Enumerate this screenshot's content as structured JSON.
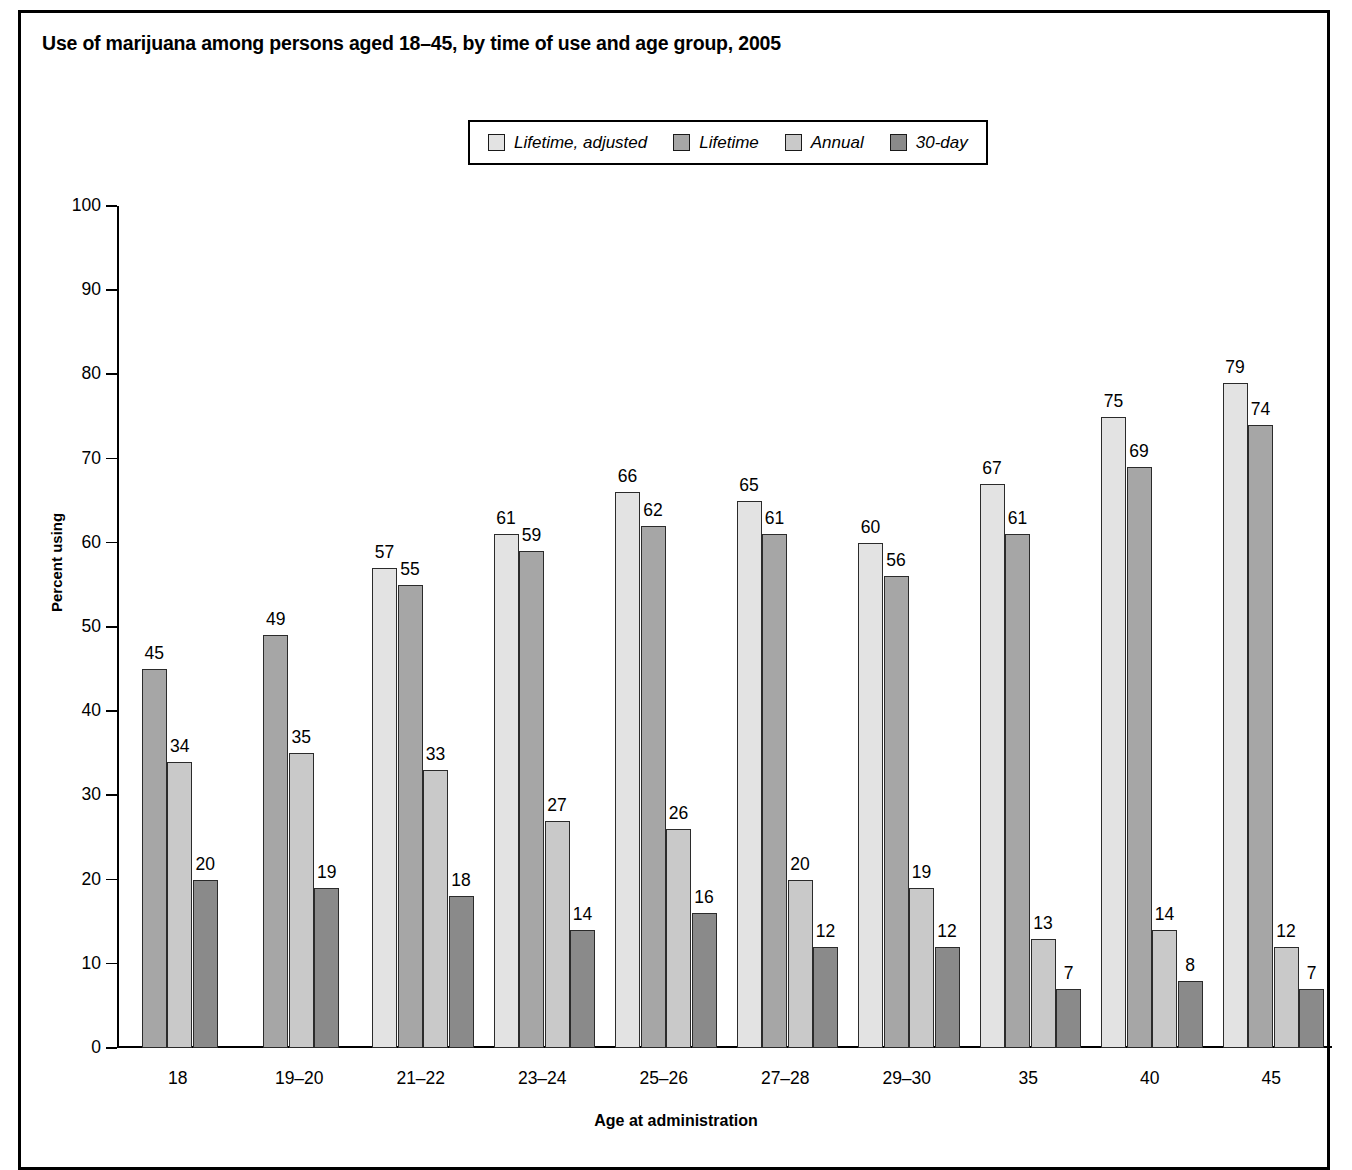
{
  "title": "Use of marijuana among persons aged 18–45, by time of use and age group, 2005",
  "axis": {
    "x_title": "Age at administration",
    "y_title": "Percent using"
  },
  "legend": {
    "items": [
      {
        "label": "Lifetime, adjusted",
        "color": "#e3e3e3"
      },
      {
        "label": "Lifetime",
        "color": "#a6a6a6"
      },
      {
        "label": "Annual",
        "color": "#c9c9c9"
      },
      {
        "label": "30-day",
        "color": "#8a8a8a"
      }
    ]
  },
  "chart_data": {
    "type": "bar",
    "title": "Use of marijuana among persons aged 18–45, by time of use and age group, 2005",
    "xlabel": "Age at administration",
    "ylabel": "Percent using",
    "ylim": [
      0,
      100
    ],
    "yticks": [
      0,
      10,
      20,
      30,
      40,
      50,
      60,
      70,
      80,
      90,
      100
    ],
    "grid": false,
    "legend_position": "top-center",
    "categories": [
      "18",
      "19–20",
      "21–22",
      "23–24",
      "25–26",
      "27–28",
      "29–30",
      "35",
      "40",
      "45"
    ],
    "series": [
      {
        "name": "Lifetime, adjusted",
        "color": "#e3e3e3",
        "values": [
          null,
          null,
          57,
          61,
          66,
          65,
          60,
          67,
          75,
          79
        ]
      },
      {
        "name": "Lifetime",
        "color": "#a6a6a6",
        "values": [
          45,
          49,
          55,
          59,
          62,
          61,
          56,
          61,
          69,
          74
        ]
      },
      {
        "name": "Annual",
        "color": "#c9c9c9",
        "values": [
          34,
          35,
          33,
          27,
          26,
          20,
          19,
          13,
          14,
          12
        ]
      },
      {
        "name": "30-day",
        "color": "#8a8a8a",
        "values": [
          20,
          19,
          18,
          14,
          16,
          12,
          12,
          7,
          8,
          7
        ]
      }
    ]
  }
}
